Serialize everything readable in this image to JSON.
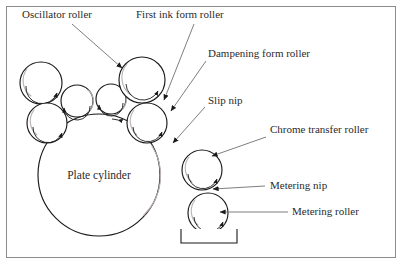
{
  "diagram": {
    "frame": {
      "x": 6,
      "y": 6,
      "width": 390,
      "height": 252,
      "stroke": "#8d8d8d"
    },
    "colors": {
      "outline": "#1a1a1a",
      "shade": "#b9b2b0",
      "leader": "#6f6f6f",
      "text": "#2b2b2b",
      "background": "#ffffff"
    },
    "labels": [
      {
        "id": "oscillator-roller",
        "text": "Oscillator roller",
        "x": 22,
        "y": 18,
        "leader": {
          "x1": 72,
          "y1": 24,
          "x2": 122,
          "y2": 68
        }
      },
      {
        "id": "first-ink-form-roller",
        "text": "First ink form roller",
        "x": 136,
        "y": 18,
        "leader": {
          "x1": 194,
          "y1": 24,
          "x2": 164,
          "y2": 100
        }
      },
      {
        "id": "dampening-form-roller",
        "text": "Dampening form roller",
        "x": 208,
        "y": 57,
        "leader": {
          "x1": 206,
          "y1": 61,
          "x2": 171,
          "y2": 111
        }
      },
      {
        "id": "slip-nip",
        "text": "Slip nip",
        "x": 208,
        "y": 104,
        "leader": {
          "x1": 205,
          "y1": 107,
          "x2": 173,
          "y2": 143
        }
      },
      {
        "id": "chrome-transfer-roller",
        "text": "Chrome transfer roller",
        "x": 270,
        "y": 133,
        "leader": {
          "x1": 266,
          "y1": 137,
          "x2": 212,
          "y2": 156
        }
      },
      {
        "id": "metering-nip",
        "text": "Metering nip",
        "x": 270,
        "y": 189,
        "leader": {
          "x1": 265,
          "y1": 186,
          "x2": 213,
          "y2": 189
        }
      },
      {
        "id": "metering-roller",
        "text": "Metering roller",
        "x": 292,
        "y": 215,
        "leader": {
          "x1": 288,
          "y1": 212,
          "x2": 220,
          "y2": 212
        }
      }
    ],
    "plate_cylinder": {
      "label": "Plate cylinder",
      "cx": 99,
      "cy": 175,
      "r": 61,
      "label_x": 99,
      "label_y": 179
    },
    "rollers": [
      {
        "id": "oscillator-roller-upper-left",
        "cx": 41,
        "cy": 83,
        "r": 21
      },
      {
        "id": "oscillator-roller-lower-left",
        "cx": 47,
        "cy": 123,
        "r": 20
      },
      {
        "id": "ink-roller-small-left",
        "cx": 77,
        "cy": 101,
        "r": 16
      },
      {
        "id": "ink-roller-small-right",
        "cx": 111,
        "cy": 99,
        "r": 15
      },
      {
        "id": "first-ink-form-roller",
        "cx": 142,
        "cy": 80,
        "r": 23
      },
      {
        "id": "dampening-form-roller",
        "cx": 147,
        "cy": 123,
        "r": 20
      },
      {
        "id": "chrome-transfer-roller",
        "cx": 202,
        "cy": 170,
        "r": 20
      },
      {
        "id": "metering-roller",
        "cx": 208,
        "cy": 213,
        "r": 20
      }
    ],
    "ink_tray": {
      "x": 181,
      "y": 229,
      "width": 56,
      "height": 14
    }
  }
}
